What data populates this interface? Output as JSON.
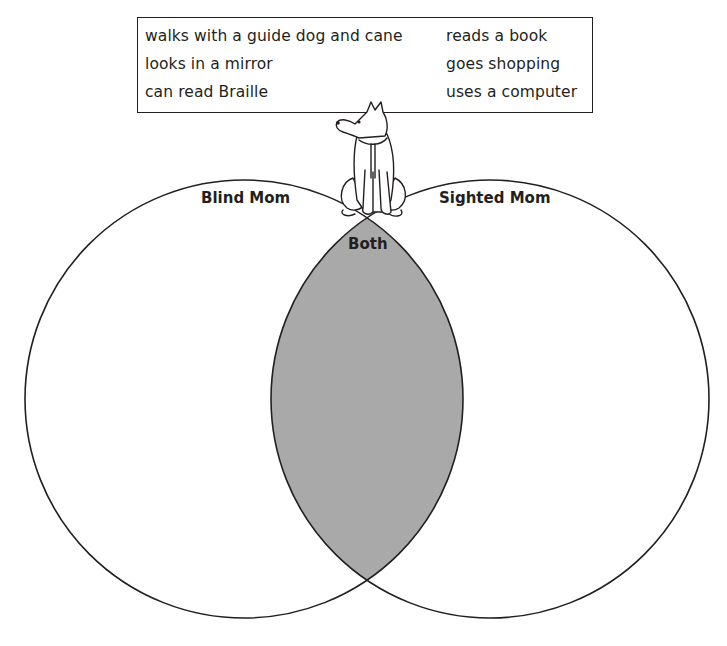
{
  "word_bank": {
    "left_column": [
      "walks with a guide dog and cane",
      "looks in a mirror",
      "can read Braille"
    ],
    "right_column": [
      "reads a book",
      "goes shopping",
      "uses a computer"
    ]
  },
  "venn": {
    "left_label": "Blind Mom",
    "right_label": "Sighted Mom",
    "overlap_label": "Both",
    "colors": {
      "stroke": "#231f20",
      "overlap_fill": "#a9a9a9",
      "background": "#ffffff"
    }
  },
  "illustration": {
    "icon": "guide-dog-icon"
  }
}
